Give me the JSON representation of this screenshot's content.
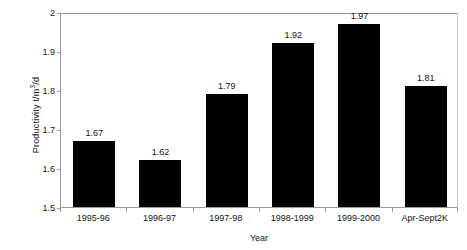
{
  "chart_data": {
    "type": "bar",
    "title": "",
    "xlabel": "Year",
    "ylabel": "Productivity t/m3/d",
    "ylabel_prefix": "Productivity t/m",
    "ylabel_sup": "3",
    "ylabel_suffix": "/d",
    "categories": [
      "1995-96",
      "1996-97",
      "1997-98",
      "1998-1999",
      "1999-2000",
      "Apr-Sept2K"
    ],
    "values": [
      1.67,
      1.62,
      1.79,
      1.92,
      1.97,
      1.81
    ],
    "value_labels": [
      "1.67",
      "1.62",
      "1.79",
      "1.92",
      "1.97",
      "1.81"
    ],
    "ylim": [
      1.5,
      2
    ],
    "ytick_labels": [
      "1.5",
      "1.6",
      "1.7",
      "1.8",
      "1.9",
      "2"
    ],
    "yticks": [
      1.5,
      1.6,
      1.7,
      1.8,
      1.9,
      2
    ],
    "grid": false,
    "legend": false,
    "bar_color": "#000000",
    "axis_color": "#9a9a9a",
    "text_color": "#141414",
    "background": "#ffffff"
  }
}
